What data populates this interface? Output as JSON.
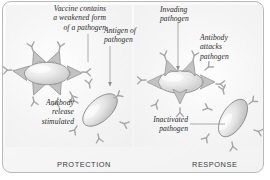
{
  "figure": {
    "panels": [
      {
        "key": "protection",
        "caption": "PROTECTION"
      },
      {
        "key": "response",
        "caption": "RESPONSE"
      }
    ],
    "captions": {
      "protection": "PROTECTION",
      "response": "RESPONSE"
    },
    "annotations": {
      "vaccine_contains": "Vaccine contains\na weakened form\nof a pathogen",
      "antigen_of_pathogen": "Antigen of\npathogen",
      "invading_pathogen": "Invading\npathogen",
      "antibody_attacks_pathogen": "Antibody\nattacks\npathogen",
      "antibody_release_stimulated": "Antibody\nrelease\nstimulated",
      "inactivated_pathogen": "Inactivated\npathogen"
    },
    "colors": {
      "background": "#ffffff",
      "panel": "#f4f4f4",
      "frame_border": "#b9b9b9",
      "text": "#2b2b2b",
      "caption_text": "#3a3a3a",
      "pathogen_fill": "#e3e3e3",
      "pathogen_outline": "#8c8c8c",
      "antibody": "#c9c9c9",
      "leader_line": "#9a9a9a"
    },
    "elements": {
      "pathogens": [
        {
          "name": "vaccine-pathogen",
          "panel": "protection",
          "cx": 47,
          "cy": 73,
          "rx": 22,
          "ry": 11,
          "rotation": 0
        },
        {
          "name": "protection-pathogen",
          "panel": "protection",
          "cx": 100,
          "cy": 110,
          "rx": 21,
          "ry": 11,
          "rotation": -42
        },
        {
          "name": "invading-pathogen",
          "panel": "response",
          "cx": 180,
          "cy": 82,
          "rx": 22,
          "ry": 11,
          "rotation": 0
        },
        {
          "name": "attacked-pathogen",
          "panel": "response",
          "cx": 233,
          "cy": 118,
          "rx": 21,
          "ry": 11,
          "rotation": -58
        }
      ],
      "antibody_count": 22,
      "leader_lines": 4
    }
  }
}
